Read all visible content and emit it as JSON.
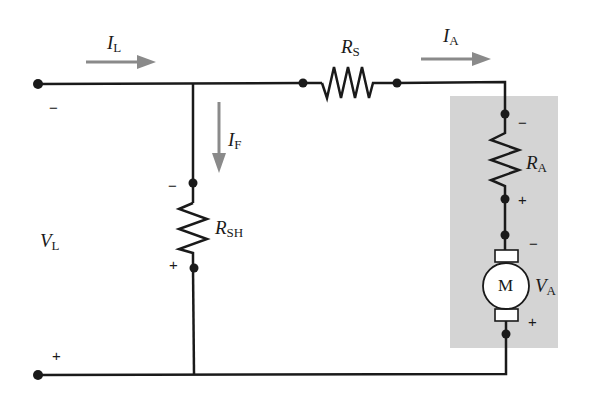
{
  "diagram": {
    "colors": {
      "wire": "#1a1a1a",
      "arrow": "#8a8a8a",
      "armature_box": "#d4d4d4",
      "motor_fill": "#ffffff"
    },
    "labels": {
      "line_current": {
        "symbol": "I",
        "sub": "L"
      },
      "field_current": {
        "symbol": "I",
        "sub": "F"
      },
      "armature_current": {
        "symbol": "I",
        "sub": "A"
      },
      "series_resistor": {
        "symbol": "R",
        "sub": "S"
      },
      "shunt_resistor": {
        "symbol": "R",
        "sub": "SH"
      },
      "armature_resistor": {
        "symbol": "R",
        "sub": "A"
      },
      "line_voltage": {
        "symbol": "V",
        "sub": "L"
      },
      "armature_voltage": {
        "symbol": "V",
        "sub": "A"
      },
      "motor": "M"
    },
    "polarity": {
      "line_top": "−",
      "line_bottom": "+",
      "shunt_top": "−",
      "shunt_bottom": "+",
      "ra_top": "−",
      "ra_bottom": "+",
      "va_top": "−",
      "va_bottom": "+"
    }
  }
}
